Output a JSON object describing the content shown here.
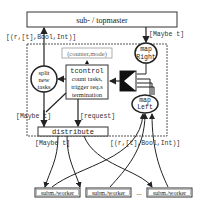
{
  "diagram": {
    "topmaster": "sub- / topmaster",
    "label_up_left": "[(r,[t],Bool,Int)]",
    "label_down_right": "[Maybe t]",
    "counter_mode": "(counter,mode)",
    "tcontrol": {
      "line1": "tcontrol",
      "line2": "count tasks,",
      "line3": "trigger req.s",
      "line4": "termination"
    },
    "split": {
      "line1": "split",
      "line2": "new",
      "line3": "tasks"
    },
    "map_right": {
      "line1": "map",
      "line2": "Right"
    },
    "map_left": {
      "line1": "map",
      "line2": "Left"
    },
    "label_maybe_left": "[Maybe t]",
    "label_request": "[request]",
    "distribute": "distribute",
    "label_maybe_bottom": "[Maybe t]",
    "label_results_bottom": "[(r,[t],Bool,Int)]",
    "workers": [
      "subm./worker",
      "subm./worker",
      "subm./worker"
    ],
    "ellipsis": "..."
  }
}
